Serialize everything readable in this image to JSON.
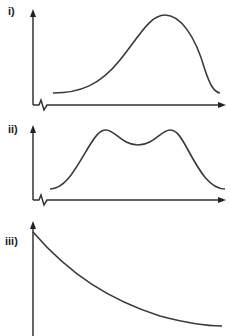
{
  "panels": [
    {
      "label": "i)",
      "description": "Single broad peak skewed to the right, with axis break on x-axis",
      "curve_shape": "skewed-peak",
      "axis_break": true
    },
    {
      "label": "ii)",
      "description": "Two peaks of equal height separated by a shallow dip, with axis break on x-axis",
      "curve_shape": "double-peak",
      "axis_break": true
    },
    {
      "label": "iii)",
      "description": "Decreasing curve starting high at the y-axis and decaying toward a minimum",
      "curve_shape": "exponential-decay",
      "axis_break": false
    }
  ],
  "colors": {
    "line": "#3a3a3a",
    "axis": "#333333",
    "background": "#ffffff"
  }
}
